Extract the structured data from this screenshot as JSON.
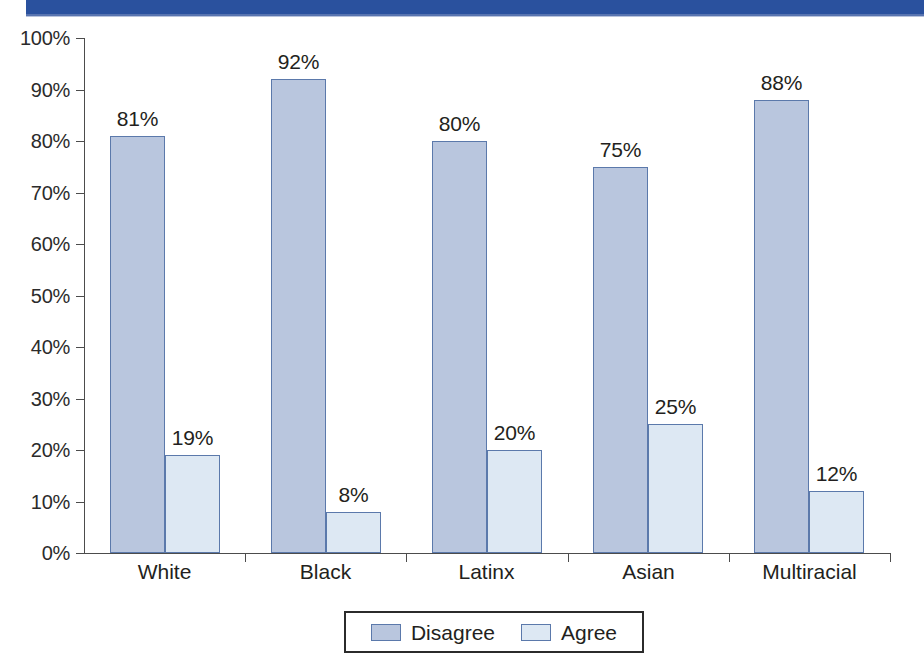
{
  "banner": {
    "color": "#2a519e",
    "label": "top-decorative-band"
  },
  "chart_data": {
    "type": "bar",
    "title": "",
    "xlabel": "",
    "ylabel": "",
    "ylim": [
      0,
      100
    ],
    "grid": false,
    "legend_position": "bottom",
    "categories": [
      "White",
      "Black",
      "Latinx",
      "Asian",
      "Multiracial"
    ],
    "ytick_labels": [
      "100%",
      "90%",
      "80%",
      "70%",
      "60%",
      "50%",
      "40%",
      "30%",
      "20%",
      "10%",
      "0%"
    ],
    "ytick_values": [
      100,
      90,
      80,
      70,
      60,
      50,
      40,
      30,
      20,
      10,
      0
    ],
    "series": [
      {
        "name": "Disagree",
        "color": "#b9c6de",
        "border": "#5b79ab",
        "values": [
          81,
          92,
          80,
          75,
          88
        ],
        "labels": [
          "81%",
          "92%",
          "80%",
          "75%",
          "88%"
        ]
      },
      {
        "name": "Agree",
        "color": "#dde8f3",
        "border": "#5b79ab",
        "values": [
          19,
          8,
          20,
          25,
          12
        ],
        "labels": [
          "19%",
          "8%",
          "20%",
          "25%",
          "12%"
        ]
      }
    ]
  },
  "legend": {
    "items": [
      {
        "label": "Disagree",
        "swatch": "disagree"
      },
      {
        "label": "Agree",
        "swatch": "agree"
      }
    ]
  }
}
